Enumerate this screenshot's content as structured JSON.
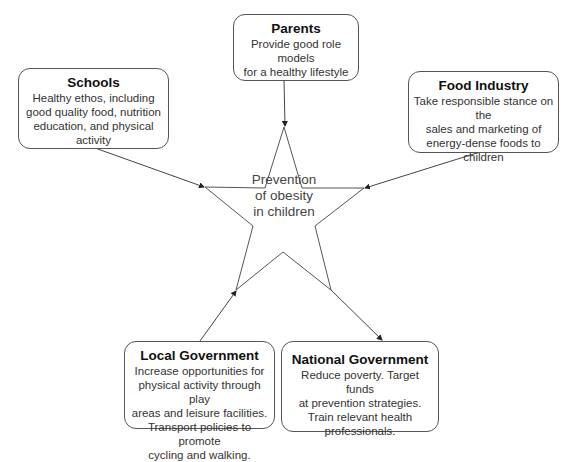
{
  "center": {
    "line1": "Prevention",
    "line2": "of obesity",
    "line3": "in children"
  },
  "nodes": {
    "parents": {
      "title": "Parents",
      "lines": [
        "Provide good role models",
        "for a healthy lifestyle"
      ]
    },
    "schools": {
      "title": "Schools",
      "lines": [
        "Healthy ethos, including",
        "good quality food, nutrition",
        "education, and physical activity"
      ]
    },
    "food_industry": {
      "title": "Food Industry",
      "lines": [
        "Take responsible stance on the",
        "sales and marketing of",
        "energy-dense foods to children"
      ]
    },
    "local_government": {
      "title": "Local Government",
      "lines": [
        "Increase opportunities for",
        "physical activity through play",
        "areas and leisure facilities.",
        "Transport policies to promote",
        "cycling and walking."
      ]
    },
    "national_government": {
      "title": "National Government",
      "lines": [
        "Reduce poverty. Target funds",
        "at prevention strategies.",
        "Train relevant health",
        "professionals."
      ]
    }
  },
  "colors": {
    "line": "#444444",
    "border": "#555555",
    "background": "#ffffff"
  }
}
